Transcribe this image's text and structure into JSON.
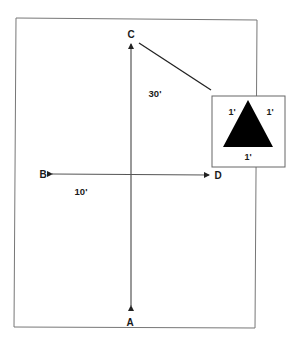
{
  "diagram": {
    "points": {
      "A": "A",
      "B": "B",
      "C": "C",
      "D": "D"
    },
    "dimensions": {
      "vertical": "30'",
      "horizontal": "10'"
    },
    "inset": {
      "shape": "triangle",
      "side_left": "1'",
      "side_right": "1'",
      "side_bottom": "1'"
    },
    "colors": {
      "line": "#333333",
      "triangle_fill": "#000000",
      "background": "#ffffff"
    }
  }
}
